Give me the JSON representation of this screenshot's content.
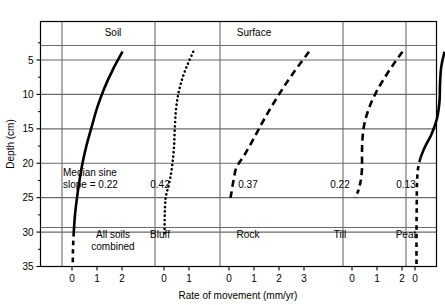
{
  "chart_data": {
    "type": "line",
    "title": "Young pit results",
    "xlabel": "Rate of movement (mm/yr)",
    "ylabel": "Depth (cm)",
    "ylim": [
      0,
      35
    ],
    "y_ticks": [
      5,
      10,
      15,
      20,
      25,
      30,
      35
    ],
    "grid": true,
    "legend_position": "none",
    "orientation": "depth-profile (y inverted, depth increases downward)",
    "group_labels": [
      "Soil",
      "Surface"
    ],
    "annotation_note": "Median sine slope = 0.22",
    "panels": [
      {
        "name": "All soils combined",
        "median_sine_slope": "0.22",
        "x_ticks": [
          0,
          1,
          2
        ],
        "xlim": [
          0,
          2.6
        ],
        "line_style": "solid",
        "line_width": 2.6,
        "points": [
          {
            "rate": 2.02,
            "depth": 3.8
          },
          {
            "rate": 1.62,
            "depth": 6.5
          },
          {
            "rate": 1.28,
            "depth": 9.2
          },
          {
            "rate": 1.0,
            "depth": 12.0
          },
          {
            "rate": 0.78,
            "depth": 14.8
          },
          {
            "rate": 0.58,
            "depth": 17.4
          },
          {
            "rate": 0.42,
            "depth": 20.0
          },
          {
            "rate": 0.3,
            "depth": 22.5
          },
          {
            "rate": 0.2,
            "depth": 25.0
          },
          {
            "rate": 0.12,
            "depth": 27.5
          },
          {
            "rate": 0.07,
            "depth": 30.0
          },
          {
            "rate": 0.04,
            "depth": 32.5
          },
          {
            "rate": 0.03,
            "depth": 35.0
          }
        ],
        "dashed_below_depth": 30.0
      },
      {
        "name": "Bluff",
        "median_sine_slope": "0.42",
        "x_ticks": [
          0,
          1
        ],
        "xlim": [
          0,
          1.5
        ],
        "line_style": "dotted",
        "line_width": 2.6,
        "points": [
          {
            "rate": 1.17,
            "depth": 3.8
          },
          {
            "rate": 0.95,
            "depth": 5.6
          },
          {
            "rate": 0.74,
            "depth": 7.6
          },
          {
            "rate": 0.58,
            "depth": 9.8
          },
          {
            "rate": 0.48,
            "depth": 12.2
          },
          {
            "rate": 0.43,
            "depth": 15.0
          },
          {
            "rate": 0.4,
            "depth": 17.6
          },
          {
            "rate": 0.34,
            "depth": 20.0
          },
          {
            "rate": 0.25,
            "depth": 22.2
          },
          {
            "rate": 0.13,
            "depth": 24.0
          },
          {
            "rate": 0.06,
            "depth": 25.2
          },
          {
            "rate": 0.03,
            "depth": 27.5
          },
          {
            "rate": 0.02,
            "depth": 30.4
          }
        ],
        "dashed_below_depth": null
      },
      {
        "name": "Rock",
        "median_sine_slope": "0.37",
        "x_ticks": [
          0,
          1,
          2,
          3
        ],
        "xlim": [
          0,
          3.4
        ],
        "line_style": "dashed",
        "line_width": 2.6,
        "points": [
          {
            "rate": 3.2,
            "depth": 3.8
          },
          {
            "rate": 2.55,
            "depth": 7.0
          },
          {
            "rate": 2.0,
            "depth": 10.0
          },
          {
            "rate": 1.5,
            "depth": 13.0
          },
          {
            "rate": 1.05,
            "depth": 16.0
          },
          {
            "rate": 0.62,
            "depth": 18.8
          },
          {
            "rate": 0.3,
            "depth": 20.6
          },
          {
            "rate": 0.18,
            "depth": 22.5
          },
          {
            "rate": 0.1,
            "depth": 24.2
          },
          {
            "rate": 0.06,
            "depth": 25.0
          }
        ],
        "dashed_below_depth": null
      },
      {
        "name": "Till",
        "median_sine_slope": "0.22",
        "x_ticks": [
          0,
          1,
          2
        ],
        "xlim": [
          0,
          2.4
        ],
        "line_style": "dashed",
        "line_width": 2.6,
        "points": [
          {
            "rate": 2.02,
            "depth": 3.8
          },
          {
            "rate": 1.7,
            "depth": 5.4
          },
          {
            "rate": 1.3,
            "depth": 7.6
          },
          {
            "rate": 0.95,
            "depth": 9.8
          },
          {
            "rate": 0.68,
            "depth": 12.0
          },
          {
            "rate": 0.5,
            "depth": 14.2
          },
          {
            "rate": 0.42,
            "depth": 16.4
          },
          {
            "rate": 0.4,
            "depth": 18.6
          },
          {
            "rate": 0.4,
            "depth": 20.8
          },
          {
            "rate": 0.35,
            "depth": 22.6
          },
          {
            "rate": 0.25,
            "depth": 24.0
          },
          {
            "rate": 0.12,
            "depth": 25.0
          }
        ],
        "dashed_below_depth": 22.0
      },
      {
        "name": "Peat",
        "median_sine_slope": "0.13",
        "x_ticks": [
          0,
          1
        ],
        "xlim": [
          0,
          1.5
        ],
        "line_style": "solid",
        "line_width": 2.6,
        "points": [
          {
            "rate": 1.18,
            "depth": 3.8
          },
          {
            "rate": 1.05,
            "depth": 6.0
          },
          {
            "rate": 1.0,
            "depth": 8.5
          },
          {
            "rate": 0.98,
            "depth": 11.0
          },
          {
            "rate": 0.88,
            "depth": 13.5
          },
          {
            "rate": 0.66,
            "depth": 15.8
          },
          {
            "rate": 0.4,
            "depth": 17.6
          },
          {
            "rate": 0.22,
            "depth": 19.2
          },
          {
            "rate": 0.12,
            "depth": 20.8
          },
          {
            "rate": 0.08,
            "depth": 23.0
          },
          {
            "rate": 0.07,
            "depth": 26.0
          },
          {
            "rate": 0.06,
            "depth": 30.0
          },
          {
            "rate": 0.06,
            "depth": 35.0
          }
        ],
        "dashed_below_depth": 19.0
      }
    ]
  },
  "figure": {
    "title": "Young pit results",
    "x_axis_title": "Rate of movement (mm/yr)",
    "y_axis_title": "Depth (cm)",
    "y_tick_labels": [
      "5",
      "10",
      "15",
      "20",
      "25",
      "30",
      "35"
    ],
    "group_label_left": "Soil",
    "group_label_right": "Surface",
    "note_line_1": "Median sine",
    "note_line_2": "slope = 0.22",
    "panel_names": {
      "p0_line1": "All soils",
      "p0_line2": "combined",
      "p1": "Bluff",
      "p2": "Rock",
      "p3": "Till",
      "p4": "Peat"
    },
    "panel_values": {
      "p0": "0.22",
      "p1": "0.42",
      "p2": "0.37",
      "p3": "0.22",
      "p4": "0.13"
    },
    "x_tick_labels": {
      "p0": [
        "0",
        "1",
        "2"
      ],
      "p1": [
        "0",
        "1"
      ],
      "p2": [
        "0",
        "1",
        "2",
        "3"
      ],
      "p3": [
        "0",
        "1",
        "2"
      ],
      "p4": [
        "0",
        "1"
      ]
    },
    "colors": {
      "frame": "#000000",
      "grid": "#6b6b6b",
      "series": "#000000",
      "background": "#ffffff"
    }
  }
}
